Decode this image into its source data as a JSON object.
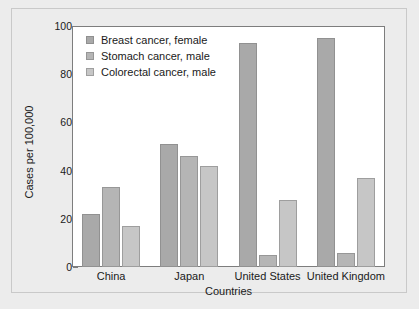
{
  "chart_data": {
    "type": "bar",
    "title": "",
    "subtitle": "",
    "xlabel": "Countries",
    "ylabel": "Cases per 100,000",
    "categories": [
      "China",
      "Japan",
      "United States",
      "United Kingdom"
    ],
    "series": [
      {
        "name": "Breast cancer, female",
        "color": "#a9a9a9",
        "values": [
          22,
          51,
          93,
          95
        ]
      },
      {
        "name": "Stomach cancer, male",
        "color": "#b5b5b5",
        "values": [
          33,
          46,
          5,
          6
        ]
      },
      {
        "name": "Colorectal cancer, male",
        "color": "#c6c6c6",
        "values": [
          17,
          42,
          28,
          37
        ]
      }
    ],
    "ylim": [
      0,
      100
    ],
    "yticks": [
      0,
      20,
      40,
      60,
      80,
      100
    ],
    "ytick_labels": [
      "0",
      "20",
      "40",
      "60",
      "80",
      "100"
    ],
    "grid": false,
    "legend_position": "top-left-inside",
    "plot_background": "#ffffff",
    "figure_background": "#ececec",
    "axis_color": "#7d7d7d",
    "text_color": "#1a1a1a"
  }
}
